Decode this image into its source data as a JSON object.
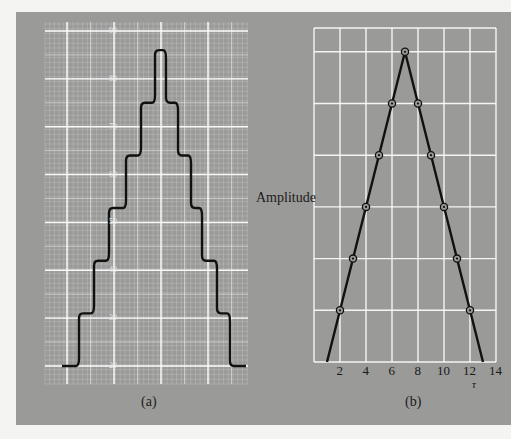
{
  "colors": {
    "page_bg": "#f4f4f2",
    "panel_bg": "#9a9a98",
    "grid": "#ffffff",
    "line": "#111111"
  },
  "chart_data": [
    {
      "id": "a",
      "type": "line",
      "caption": "(a)",
      "title": "",
      "xlabel": "",
      "ylabel": "",
      "y_tick_labels": [
        "20",
        "30",
        "40",
        "50",
        "60",
        "70",
        "80",
        "90"
      ],
      "ylim": [
        20,
        90
      ],
      "grid": true,
      "description": "Staircase waveform rising in equal steps to a peak and descending symmetrically",
      "step_levels": [
        20,
        31,
        42,
        53,
        64,
        75,
        86,
        75,
        64,
        53,
        42,
        31,
        20
      ]
    },
    {
      "id": "b",
      "type": "line",
      "caption": "(b)",
      "title": "",
      "xlabel": "τ",
      "ylabel": "Amplitude",
      "x_tick_labels": [
        "2",
        "4",
        "6",
        "8",
        "10",
        "12",
        "14"
      ],
      "xlim": [
        0,
        14
      ],
      "grid": true,
      "description": "Triangular function of τ with circled sample points, peak at τ = 7",
      "series": [
        {
          "name": "triangle",
          "x": [
            2,
            3,
            4,
            5,
            6,
            7,
            8,
            9,
            10,
            11,
            12
          ],
          "y": [
            1,
            2,
            3,
            4,
            5,
            6,
            5,
            4,
            3,
            2,
            1
          ]
        }
      ],
      "line_extent": {
        "x_start": 1,
        "x_peak": 7,
        "x_end": 13
      }
    }
  ]
}
